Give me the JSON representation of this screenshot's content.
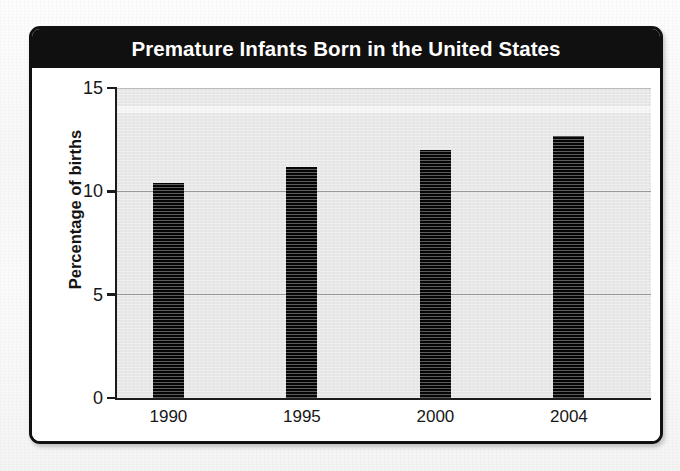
{
  "figure": {
    "title": "Premature Infants Born in the United States"
  },
  "chart_data": {
    "type": "bar",
    "title": "Premature Infants Born in the United States",
    "xlabel": "Year",
    "ylabel": "Percentage of births",
    "categories": [
      "1990",
      "1995",
      "2000",
      "2004"
    ],
    "values": [
      10.4,
      11.2,
      12.0,
      12.7
    ],
    "ylim": [
      0,
      15
    ],
    "yticks": [
      0,
      5,
      10,
      15
    ],
    "ytick_labels": [
      "0",
      "5",
      "10",
      "15"
    ],
    "grid": true,
    "legend": false,
    "bar_color": "#050505",
    "plot_background": "#e7e7e7",
    "title_background": "#111010",
    "title_color": "#ffffff"
  }
}
